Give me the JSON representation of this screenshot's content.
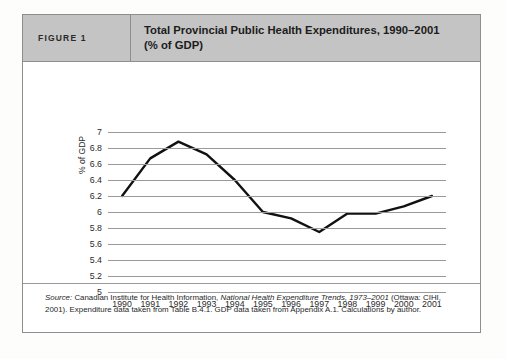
{
  "figure": {
    "tag": "FIGURE 1",
    "title_line1": "Total Provincial Public Health Expenditures, 1990–2001",
    "title_line2": "(% of GDP)",
    "header_bg": "#c4c4c4",
    "border_color": "#8e8e8e"
  },
  "footnote": {
    "source_label": "Source:",
    "part1": " Canadian Institute for Health Information, ",
    "publication": "National Health Expenditure Trends, 1973–2001",
    "part2": " (Ottawa:",
    "line2": "CIHI, 2001). Expenditure data taken from Table B.4.1. GDP data taken from Appendix A.1. Calculations by author."
  },
  "chart_data": {
    "type": "line",
    "title": "Total Provincial Public Health Expenditures, 1990–2001 (% of GDP)",
    "xlabel": "",
    "ylabel": "% of GDP",
    "categories": [
      "1990",
      "1991",
      "1992",
      "1993",
      "1994",
      "1995",
      "1996",
      "1997",
      "1998",
      "1999",
      "2000",
      "2001"
    ],
    "values": [
      6.2,
      6.67,
      6.88,
      6.72,
      6.4,
      6.0,
      5.92,
      5.75,
      5.98,
      5.98,
      6.07,
      6.2
    ],
    "ylim": [
      5,
      7
    ],
    "ytick_step": 0.2,
    "ytick_labels": [
      "7",
      "6.8",
      "6.6",
      "6.4",
      "6.2",
      "6",
      "5.8",
      "5.6",
      "5.4",
      "5.2",
      "5"
    ],
    "grid": true,
    "legend": "none",
    "line_color": "#111111",
    "grid_color": "#9a9a9a"
  }
}
